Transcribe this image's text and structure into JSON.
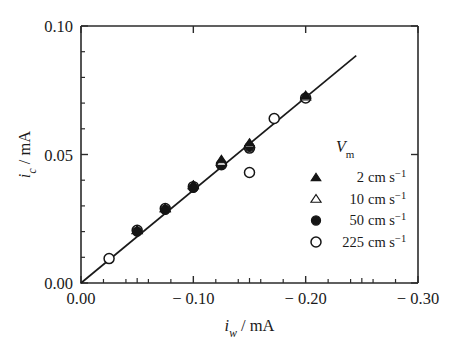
{
  "figure": {
    "background": "#ffffff",
    "frame_color": "#2b2b2b",
    "marker_color": "#151515"
  },
  "axes": {
    "x": {
      "label_symbol": "i",
      "label_sub": "w",
      "label_unit": "/ mA",
      "label_full": "i_w / mA",
      "ticks": [
        "0.00",
        "− 0.10",
        "− 0.20",
        "− 0.30"
      ],
      "tick_values": [
        0.0,
        -0.1,
        -0.2,
        -0.3
      ],
      "minor_per_interval": 4,
      "range": [
        0.0,
        -0.3
      ]
    },
    "y": {
      "label_symbol": "i",
      "label_sub": "c",
      "label_unit": "/ mA",
      "label_full": "i_c / mA",
      "ticks": [
        "0.00",
        "0.05",
        "0.10"
      ],
      "tick_values": [
        0.0,
        0.05,
        0.1
      ],
      "minor_per_interval": 5,
      "range": [
        0.0,
        0.1
      ]
    }
  },
  "legend": {
    "title_symbol": "V",
    "title_sub": "m",
    "title_full": "V_m",
    "entries": [
      {
        "marker": "filled-triangle",
        "value": "2",
        "unit": "cm s",
        "exponent": "−1",
        "label": "2 cm s⁻¹"
      },
      {
        "marker": "open-triangle",
        "value": "10",
        "unit": "cm s",
        "exponent": "−1",
        "label": "10 cm s⁻¹"
      },
      {
        "marker": "filled-circle",
        "value": "50",
        "unit": "cm s",
        "exponent": "−1",
        "label": "50 cm s⁻¹"
      },
      {
        "marker": "open-circle",
        "value": "225",
        "unit": "cm s",
        "exponent": "−1",
        "label": "225 cm s⁻¹"
      }
    ]
  },
  "chart_data": {
    "type": "scatter",
    "title": "",
    "xlabel": "i_w / mA",
    "ylabel": "i_c / mA",
    "xlim": [
      0.0,
      -0.3
    ],
    "ylim": [
      0.0,
      0.1
    ],
    "grid": false,
    "legend_position": "right-inside",
    "trendline": {
      "type": "line",
      "x": [
        0.0,
        -0.245
      ],
      "y": [
        0.0,
        0.0885
      ],
      "slope": 0.361,
      "intercept": 0.0
    },
    "series": [
      {
        "name": "2 cm s⁻¹",
        "marker": "filled-triangle",
        "points": [
          {
            "x": -0.05,
            "y": 0.0205
          },
          {
            "x": -0.075,
            "y": 0.029
          },
          {
            "x": -0.1,
            "y": 0.038
          },
          {
            "x": -0.125,
            "y": 0.048
          },
          {
            "x": -0.15,
            "y": 0.0545
          },
          {
            "x": -0.2,
            "y": 0.073
          }
        ]
      },
      {
        "name": "10 cm s⁻¹",
        "marker": "open-triangle",
        "points": [
          {
            "x": -0.05,
            "y": 0.0205
          },
          {
            "x": -0.075,
            "y": 0.029
          },
          {
            "x": -0.1,
            "y": 0.038
          },
          {
            "x": -0.125,
            "y": 0.047
          },
          {
            "x": -0.15,
            "y": 0.054
          },
          {
            "x": -0.2,
            "y": 0.0725
          }
        ]
      },
      {
        "name": "50 cm s⁻¹",
        "marker": "filled-circle",
        "points": [
          {
            "x": -0.05,
            "y": 0.02
          },
          {
            "x": -0.075,
            "y": 0.0285
          },
          {
            "x": -0.1,
            "y": 0.037
          },
          {
            "x": -0.125,
            "y": 0.046
          },
          {
            "x": -0.15,
            "y": 0.053
          }
        ]
      },
      {
        "name": "225 cm s⁻¹",
        "marker": "open-circle",
        "points": [
          {
            "x": -0.025,
            "y": 0.0095
          },
          {
            "x": -0.05,
            "y": 0.0205
          },
          {
            "x": -0.075,
            "y": 0.029
          },
          {
            "x": -0.1,
            "y": 0.0375
          },
          {
            "x": -0.125,
            "y": 0.046
          },
          {
            "x": -0.15,
            "y": 0.0525
          },
          {
            "x": -0.15,
            "y": 0.043
          },
          {
            "x": -0.172,
            "y": 0.064
          },
          {
            "x": -0.2,
            "y": 0.072
          }
        ]
      }
    ]
  }
}
